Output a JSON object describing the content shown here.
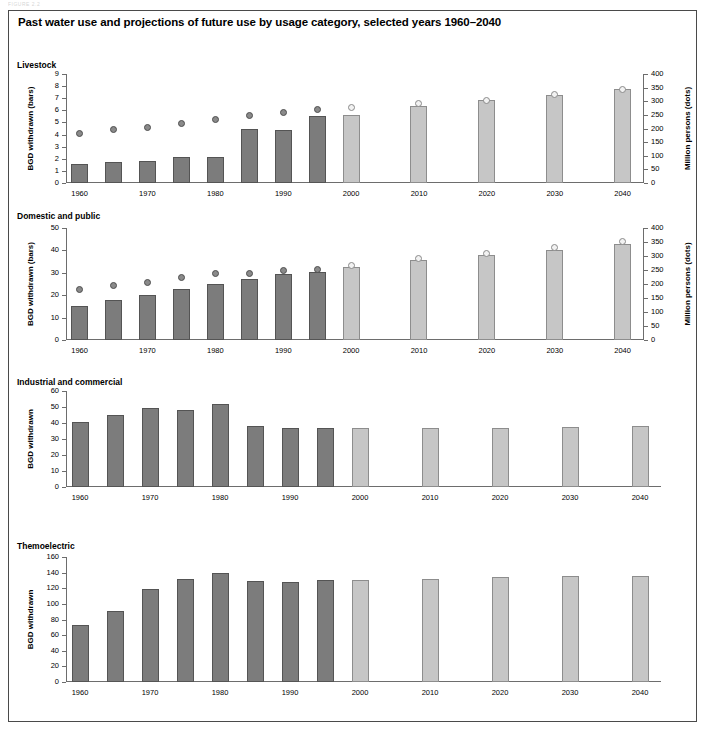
{
  "document": {
    "header_fragment": "FIGURE 2.2",
    "title": "Past water use and projections of future use by usage category, selected years 1960–2040"
  },
  "axis": {
    "x_tick_labels": [
      "1960",
      "1970",
      "1980",
      "1990",
      "2000",
      "2010",
      "2020",
      "2030",
      "2040"
    ],
    "left_label_bars": "BGD withdrawn (bars)",
    "left_label_plain": "BGD withdrawn",
    "right_label": "Million persons (dots)"
  },
  "chart_data": [
    {
      "type": "bar",
      "title": "Livestock",
      "xlabel": "",
      "ylabel": "BGD withdrawn (bars)",
      "y2label": "Million persons (dots)",
      "ylim": [
        0,
        9
      ],
      "yticks": [
        0,
        1,
        2,
        3,
        4,
        5,
        6,
        7,
        8,
        9
      ],
      "y2lim": [
        0,
        400
      ],
      "y2ticks": [
        0,
        50,
        100,
        150,
        200,
        250,
        300,
        350,
        400
      ],
      "grid": false,
      "legend": "none",
      "x": [
        1960,
        1965,
        1970,
        1975,
        1980,
        1985,
        1990,
        1995,
        2000,
        2010,
        2020,
        2030,
        2040
      ],
      "series": [
        {
          "name": "BGD withdrawn",
          "kind": "bar",
          "values": [
            1.6,
            1.7,
            1.8,
            2.15,
            2.15,
            4.45,
            4.4,
            5.5,
            5.65,
            6.35,
            6.85,
            7.3,
            7.8
          ],
          "projection_from": 2000
        },
        {
          "name": "Million persons",
          "kind": "dot",
          "axis": "right",
          "values": [
            180,
            195,
            205,
            217,
            233,
            249,
            258,
            271,
            277,
            290,
            302,
            323,
            344
          ],
          "projection_from": 2000
        }
      ]
    },
    {
      "type": "bar",
      "title": "Domestic and public",
      "xlabel": "",
      "ylabel": "BGD withdrawn (bars)",
      "y2label": "Million persons (dots)",
      "ylim": [
        0,
        50
      ],
      "yticks": [
        0,
        10,
        20,
        30,
        40,
        50
      ],
      "y2lim": [
        0,
        400
      ],
      "y2ticks": [
        0,
        50,
        100,
        150,
        200,
        250,
        300,
        350,
        400
      ],
      "grid": false,
      "legend": "none",
      "x": [
        1960,
        1965,
        1970,
        1975,
        1980,
        1985,
        1990,
        1995,
        2000,
        2010,
        2020,
        2030,
        2040
      ],
      "series": [
        {
          "name": "BGD withdrawn",
          "kind": "bar",
          "values": [
            15.3,
            17.9,
            20.3,
            22.7,
            24.8,
            27.1,
            29.5,
            30.5,
            32.5,
            35.7,
            37.8,
            40.1,
            42.7
          ],
          "projection_from": 2000
        },
        {
          "name": "Million persons",
          "kind": "dot",
          "axis": "right",
          "values": [
            180,
            195,
            207,
            222,
            238,
            236,
            248,
            253,
            267,
            291,
            308,
            330,
            353
          ],
          "projection_from": 2000
        }
      ]
    },
    {
      "type": "bar",
      "title": "Industrial and commercial",
      "xlabel": "",
      "ylabel": "BGD withdrawn",
      "ylim": [
        0,
        60
      ],
      "yticks": [
        0,
        10,
        20,
        30,
        40,
        50,
        60
      ],
      "grid": false,
      "legend": "none",
      "x": [
        1960,
        1965,
        1970,
        1975,
        1980,
        1985,
        1990,
        1995,
        2000,
        2010,
        2020,
        2030,
        2040
      ],
      "series": [
        {
          "name": "BGD withdrawn",
          "kind": "bar",
          "values": [
            40.8,
            45.2,
            49.1,
            48.4,
            52.1,
            37.9,
            37.1,
            37.1,
            36.9,
            36.9,
            36.9,
            37.2,
            38.1
          ],
          "projection_from": 2000
        }
      ]
    },
    {
      "type": "bar",
      "title": "Themoelectric",
      "xlabel": "",
      "ylabel": "BGD withdrawn",
      "ylim": [
        0,
        160
      ],
      "yticks": [
        0,
        20,
        40,
        60,
        80,
        100,
        120,
        140,
        160
      ],
      "grid": false,
      "legend": "none",
      "x": [
        1960,
        1965,
        1970,
        1975,
        1980,
        1985,
        1990,
        1995,
        2000,
        2010,
        2020,
        2030,
        2040
      ],
      "series": [
        {
          "name": "BGD withdrawn",
          "kind": "bar",
          "values": [
            73.5,
            91.5,
            119.5,
            131.5,
            139.5,
            129,
            128.5,
            130.5,
            130.5,
            132,
            134.5,
            135.5,
            135.5
          ],
          "projection_from": 2000
        }
      ]
    }
  ]
}
